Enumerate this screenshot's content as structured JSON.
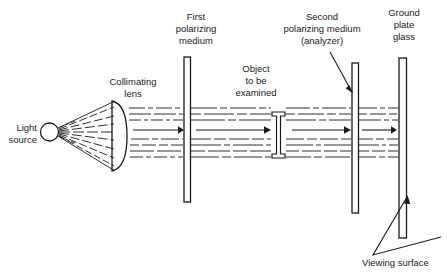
{
  "figure": {
    "kind": "optical-diagram",
    "title_visible": false,
    "background_color": "#ffffff",
    "ink_color": "#1a1a1a",
    "width": 447,
    "height": 273
  },
  "labels": {
    "light_source": {
      "line1": "Light",
      "line2": "source"
    },
    "collimating_lens": {
      "line1": "Collimating",
      "line2": "lens"
    },
    "first_polarizer": {
      "line1": "First",
      "line2": "polarizing",
      "line3": "medium"
    },
    "object": {
      "line1": "Object",
      "line2": "to be",
      "line3": "examined"
    },
    "second_polarizer": {
      "line1": "Second",
      "line2": "polarizing medium",
      "line3": "(analyzer)"
    },
    "ground_glass": {
      "line1": "Ground",
      "line2": "plate",
      "line3": "glass"
    },
    "viewing_surface": {
      "line1": "Viewing surface"
    }
  },
  "components": [
    {
      "name": "light-source",
      "type": "circle",
      "cx": 49.5,
      "cy": 132,
      "r": 9
    },
    {
      "name": "collimating-lens",
      "type": "plano-convex-lens",
      "x": 112,
      "y": 100,
      "width": 16,
      "height": 72
    },
    {
      "name": "first-polarizing-medium",
      "type": "plate",
      "x": 184,
      "y": 57,
      "width": 6.5,
      "height": 145
    },
    {
      "name": "object-to-be-examined",
      "type": "i-beam",
      "x": 272,
      "y": 112,
      "width": 13,
      "height": 46
    },
    {
      "name": "second-polarizing-medium",
      "type": "plate",
      "x": 352,
      "y": 63,
      "width": 6.5,
      "height": 150
    },
    {
      "name": "ground-plate-glass",
      "type": "plate",
      "x": 399,
      "y": 58,
      "width": 7.5,
      "height": 180
    }
  ],
  "beam": {
    "description": "collimated polarized light, drawn as dashed horizontal rays with solid direction arrows",
    "ray_count": 9,
    "top_y": 108,
    "bottom_y": 158,
    "arrow_segments": [
      {
        "name": "arrow-after-lens",
        "x1": 131,
        "x2": 182,
        "y": 130
      },
      {
        "name": "arrow-after-first-polarizer",
        "x1": 196,
        "x2": 268,
        "y": 130
      },
      {
        "name": "arrow-after-object",
        "x1": 290,
        "x2": 349,
        "y": 130
      },
      {
        "name": "arrow-after-analyzer",
        "x1": 361,
        "x2": 397,
        "y": 130
      }
    ]
  },
  "leaders": [
    {
      "name": "leader-second-polarizer",
      "from": [
        330,
        58
      ],
      "to": [
        354,
        92
      ]
    },
    {
      "name": "leader-viewing-surface",
      "points": "[[441,236],[372,268],[408,194]]"
    }
  ]
}
